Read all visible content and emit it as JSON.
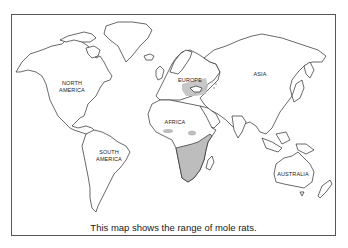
{
  "map": {
    "title": "World map – range of mole rats",
    "labels": {
      "north_america": "NORTH\nAMERICA",
      "south_america": "SOUTH\nAMERICA",
      "europe": "EUROPE",
      "asia": "ASIA",
      "africa": "AFRICA",
      "australia": "AUSTRALIA"
    },
    "legend": {
      "shaded_meaning": "range of mole rats",
      "shaded_color": "#bdbdbd"
    },
    "shaded_regions": [
      "Sub-Saharan southern Africa",
      "East Africa / Horn of Africa",
      "Patches in West/Central Africa",
      "Eastern Europe / Black Sea region"
    ],
    "caption": "This map shows the range of mole rats."
  }
}
